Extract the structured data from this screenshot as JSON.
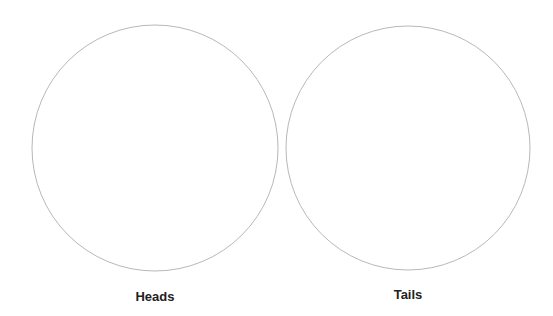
{
  "figure": {
    "coins": [
      {
        "label": "Heads",
        "cx": 155,
        "cy": 148,
        "r": 123
      },
      {
        "label": "Tails",
        "cx": 408,
        "cy": 148,
        "r": 122
      }
    ],
    "stroke_color": "#b8b8b8",
    "background": "#ffffff"
  }
}
